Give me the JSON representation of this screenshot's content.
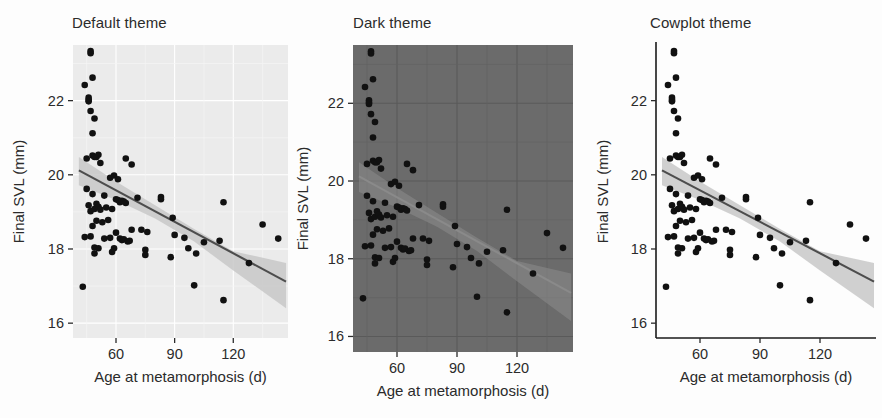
{
  "figure": {
    "panels": [
      {
        "title": "Default theme",
        "theme_key": "default",
        "panel_bg": "#ebebeb",
        "grid_color": "#ffffff",
        "axis_line": "none"
      },
      {
        "title": "Dark theme",
        "theme_key": "dark",
        "panel_bg": "#6b6b6b",
        "grid_color": "#5a5a5a",
        "axis_line": "none"
      },
      {
        "title": "Cowplot theme",
        "theme_key": "cowplot",
        "panel_bg": "#ffffff",
        "grid_color": "none",
        "axis_line": "#1a1a1a"
      }
    ]
  },
  "chart_data": {
    "type": "scatter",
    "title": "",
    "xlabel": "Age at metamorphosis (d)",
    "ylabel": "Final SVL (mm)",
    "xlim": [
      38,
      148
    ],
    "ylim": [
      15.6,
      23.5
    ],
    "xticks": [
      60,
      90,
      120
    ],
    "xticklabels": [
      "60",
      "90",
      "120"
    ],
    "yticks": [
      16,
      18,
      20,
      22
    ],
    "yticklabels": [
      "16",
      "18",
      "20",
      "22"
    ],
    "grid": "panel-dependent",
    "legend": "none",
    "point_color": "#111111",
    "line_color": "#4d4d4d",
    "ribbon_color": "#c8c8c8",
    "fit_line": {
      "x0": 41,
      "y0": 20.12,
      "x1": 147,
      "y1": 17.12
    },
    "ribbon_upper": [
      {
        "x": 41,
        "y": 20.48
      },
      {
        "x": 60,
        "y": 19.82
      },
      {
        "x": 80,
        "y": 19.18
      },
      {
        "x": 100,
        "y": 18.54
      },
      {
        "x": 120,
        "y": 17.94
      },
      {
        "x": 147,
        "y": 17.62
      }
    ],
    "ribbon_lower": [
      {
        "x": 41,
        "y": 19.72
      },
      {
        "x": 60,
        "y": 19.32
      },
      {
        "x": 80,
        "y": 18.82
      },
      {
        "x": 100,
        "y": 18.2
      },
      {
        "x": 120,
        "y": 17.42
      },
      {
        "x": 147,
        "y": 16.4
      }
    ],
    "points": [
      {
        "x": 43,
        "y": 16.98
      },
      {
        "x": 44,
        "y": 18.32
      },
      {
        "x": 44,
        "y": 22.42
      },
      {
        "x": 45,
        "y": 20.44
      },
      {
        "x": 45,
        "y": 19.62
      },
      {
        "x": 46,
        "y": 21.98
      },
      {
        "x": 46,
        "y": 22.08
      },
      {
        "x": 46,
        "y": 22.02
      },
      {
        "x": 46,
        "y": 19.18
      },
      {
        "x": 47,
        "y": 23.34
      },
      {
        "x": 47,
        "y": 23.28
      },
      {
        "x": 47,
        "y": 21.72
      },
      {
        "x": 47,
        "y": 19.02
      },
      {
        "x": 47,
        "y": 18.34
      },
      {
        "x": 48,
        "y": 22.62
      },
      {
        "x": 48,
        "y": 21.12
      },
      {
        "x": 48,
        "y": 20.52
      },
      {
        "x": 48,
        "y": 19.48
      },
      {
        "x": 48,
        "y": 18.62
      },
      {
        "x": 49,
        "y": 21.52
      },
      {
        "x": 49,
        "y": 20.48
      },
      {
        "x": 49,
        "y": 19.08
      },
      {
        "x": 49,
        "y": 18.04
      },
      {
        "x": 49,
        "y": 17.88
      },
      {
        "x": 50,
        "y": 20.48
      },
      {
        "x": 50,
        "y": 19.22
      },
      {
        "x": 50,
        "y": 18.76
      },
      {
        "x": 51,
        "y": 20.54
      },
      {
        "x": 51,
        "y": 19.14
      },
      {
        "x": 51,
        "y": 18.02
      },
      {
        "x": 52,
        "y": 20.32
      },
      {
        "x": 52,
        "y": 19.06
      },
      {
        "x": 53,
        "y": 18.72
      },
      {
        "x": 54,
        "y": 19.44
      },
      {
        "x": 54,
        "y": 18.28
      },
      {
        "x": 55,
        "y": 19.12
      },
      {
        "x": 56,
        "y": 18.78
      },
      {
        "x": 57,
        "y": 19.92
      },
      {
        "x": 57,
        "y": 18.3
      },
      {
        "x": 58,
        "y": 19.08
      },
      {
        "x": 58,
        "y": 17.92
      },
      {
        "x": 59,
        "y": 19.98
      },
      {
        "x": 59,
        "y": 18.02
      },
      {
        "x": 60,
        "y": 19.34
      },
      {
        "x": 60,
        "y": 18.44
      },
      {
        "x": 61,
        "y": 19.88
      },
      {
        "x": 61,
        "y": 19.32
      },
      {
        "x": 62,
        "y": 19.26
      },
      {
        "x": 62,
        "y": 18.28
      },
      {
        "x": 63,
        "y": 19.3
      },
      {
        "x": 63,
        "y": 18.24
      },
      {
        "x": 64,
        "y": 19.28
      },
      {
        "x": 64,
        "y": 18.26
      },
      {
        "x": 65,
        "y": 20.44
      },
      {
        "x": 65,
        "y": 19.24
      },
      {
        "x": 66,
        "y": 18.2
      },
      {
        "x": 67,
        "y": 18.22
      },
      {
        "x": 68,
        "y": 20.28
      },
      {
        "x": 68,
        "y": 18.52
      },
      {
        "x": 71,
        "y": 19.38
      },
      {
        "x": 73,
        "y": 18.52
      },
      {
        "x": 75,
        "y": 17.98
      },
      {
        "x": 75,
        "y": 17.84
      },
      {
        "x": 76,
        "y": 18.46
      },
      {
        "x": 83,
        "y": 19.4
      },
      {
        "x": 83,
        "y": 19.34
      },
      {
        "x": 88,
        "y": 17.78
      },
      {
        "x": 89,
        "y": 18.84
      },
      {
        "x": 90,
        "y": 18.38
      },
      {
        "x": 95,
        "y": 18.3
      },
      {
        "x": 97,
        "y": 18.02
      },
      {
        "x": 100,
        "y": 17.02
      },
      {
        "x": 101,
        "y": 17.88
      },
      {
        "x": 105,
        "y": 18.18
      },
      {
        "x": 113,
        "y": 18.22
      },
      {
        "x": 115,
        "y": 19.26
      },
      {
        "x": 115,
        "y": 16.62
      },
      {
        "x": 128,
        "y": 17.62
      },
      {
        "x": 135,
        "y": 18.66
      },
      {
        "x": 143,
        "y": 18.28
      }
    ]
  }
}
